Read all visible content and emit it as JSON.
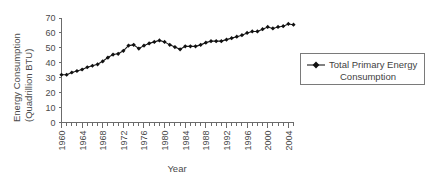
{
  "chart_data": {
    "type": "line",
    "title": "",
    "xlabel": "Year",
    "ylabel": "Energy Consumption (Quadrillion BTU)",
    "ylabel_line1": "Energy Consumption",
    "ylabel_line2": "(Quadrillion BTU)",
    "ylim": [
      0,
      70
    ],
    "ytick_values": [
      0,
      10,
      20,
      30,
      40,
      50,
      60,
      70
    ],
    "ytick_labels": [
      "0",
      "10",
      "20",
      "30",
      "40",
      "50",
      "60",
      "70"
    ],
    "xlim": [
      1960,
      2005
    ],
    "xtick_labels": [
      "1960",
      "1964",
      "1968",
      "1972",
      "1976",
      "1980",
      "1984",
      "1988",
      "1992",
      "1996",
      "2000",
      "2004"
    ],
    "xtick_values": [
      1960,
      1964,
      1968,
      1972,
      1976,
      1980,
      1984,
      1988,
      1992,
      1996,
      2000,
      2004
    ],
    "minor_xticks_every": 1,
    "grid": false,
    "legend_position": "right",
    "marker": "diamond",
    "series": [
      {
        "name": "Total Primary Energy Consumption",
        "color": "#111111",
        "x": [
          1960,
          1961,
          1962,
          1963,
          1964,
          1965,
          1966,
          1967,
          1968,
          1969,
          1970,
          1971,
          1972,
          1973,
          1974,
          1975,
          1976,
          1977,
          1978,
          1979,
          1980,
          1981,
          1982,
          1983,
          1984,
          1985,
          1986,
          1987,
          1988,
          1989,
          1990,
          1991,
          1992,
          1993,
          1994,
          1995,
          1996,
          1997,
          1998,
          1999,
          2000,
          2001,
          2002,
          2003,
          2004,
          2005
        ],
        "values": [
          32.0,
          32.0,
          33.5,
          34.5,
          35.5,
          37.0,
          38.0,
          39.0,
          41.0,
          43.5,
          45.5,
          46.0,
          48.0,
          51.5,
          52.0,
          49.5,
          51.5,
          53.0,
          54.0,
          55.0,
          54.0,
          52.0,
          50.5,
          49.0,
          51.0,
          51.0,
          51.0,
          52.0,
          53.5,
          54.5,
          54.5,
          54.5,
          55.5,
          56.5,
          57.5,
          58.5,
          60.0,
          61.0,
          61.0,
          62.5,
          64.0,
          63.0,
          64.0,
          64.5,
          66.0,
          65.5
        ]
      }
    ]
  },
  "legend": {
    "label_line1": "Total Primary Energy",
    "label_line2": "Consumption"
  }
}
